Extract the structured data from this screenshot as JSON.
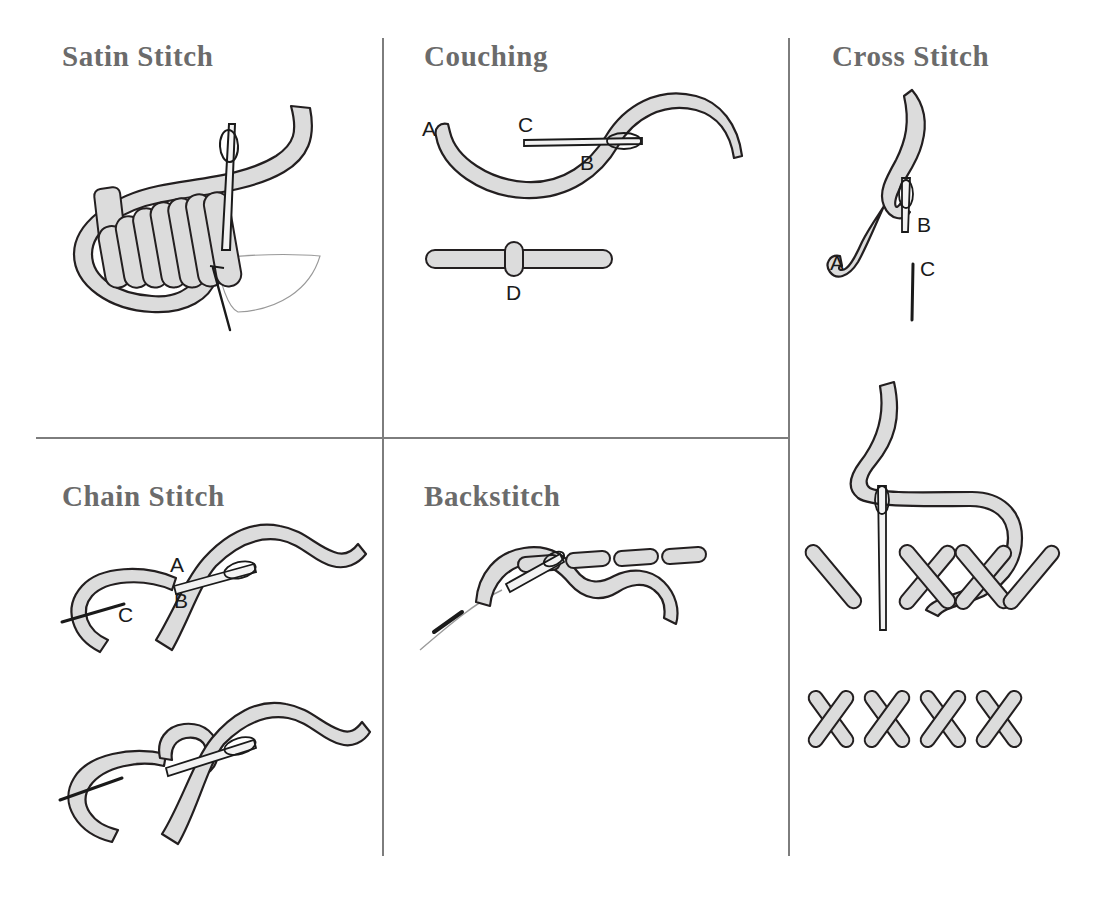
{
  "page": {
    "background_color": "#ffffff",
    "width": 1093,
    "height": 898
  },
  "style": {
    "thread_fill": "#dcdcdc",
    "thread_outline": "#231f20",
    "needle_fill": "#f2f2f2",
    "needle_outline": "#1a1a1a",
    "title_color": "#6b6b6b",
    "divider_color": "#7d7d7d",
    "label_color": "#1a1a1a"
  },
  "panels": [
    {
      "id": "satin-stitch",
      "title": "Satin Stitch",
      "figures": [
        {
          "id": "satin-main",
          "caption": "",
          "labels": [],
          "elements": [
            "thread-loop",
            "satin-fill-stitches",
            "needle",
            "fabric-edge"
          ]
        }
      ]
    },
    {
      "id": "couching",
      "title": "Couching",
      "figures": [
        {
          "id": "couching-step-1",
          "caption": "",
          "labels": [
            "A",
            "C",
            "B"
          ],
          "elements": [
            "thread-s-curve",
            "needle-horizontal"
          ]
        },
        {
          "id": "couching-step-2",
          "caption": "",
          "labels": [
            "D"
          ],
          "elements": [
            "laid-thread-bar",
            "couching-stitch"
          ]
        }
      ]
    },
    {
      "id": "cross-stitch",
      "title": "Cross Stitch",
      "figures": [
        {
          "id": "cross-step-1",
          "caption": "",
          "labels": [
            "A",
            "B",
            "C"
          ],
          "elements": [
            "thread-s-curve-vertical",
            "needle",
            "needle-mark"
          ]
        },
        {
          "id": "cross-step-2",
          "caption": "",
          "labels": [],
          "elements": [
            "thread-curve",
            "needle",
            "cross-stitches-partial"
          ]
        },
        {
          "id": "cross-step-3",
          "caption": "",
          "labels": [],
          "elements": [
            "completed-cross-stitch-row"
          ]
        }
      ]
    },
    {
      "id": "chain-stitch",
      "title": "Chain Stitch",
      "figures": [
        {
          "id": "chain-step-1",
          "caption": "",
          "labels": [
            "A",
            "B",
            "C"
          ],
          "elements": [
            "thread-loop",
            "needle",
            "thread-tail"
          ]
        },
        {
          "id": "chain-step-2",
          "caption": "",
          "labels": [],
          "elements": [
            "thread-loop",
            "interlocked-loop",
            "needle",
            "thread-tail"
          ]
        }
      ]
    },
    {
      "id": "backstitch",
      "title": "Backstitch",
      "figures": [
        {
          "id": "backstitch-main",
          "caption": "",
          "labels": [],
          "elements": [
            "thread-curve",
            "completed-stitch-segments",
            "needle",
            "thread-trail"
          ]
        }
      ]
    }
  ],
  "labels": {
    "A": "A",
    "B": "B",
    "C": "C",
    "D": "D"
  }
}
